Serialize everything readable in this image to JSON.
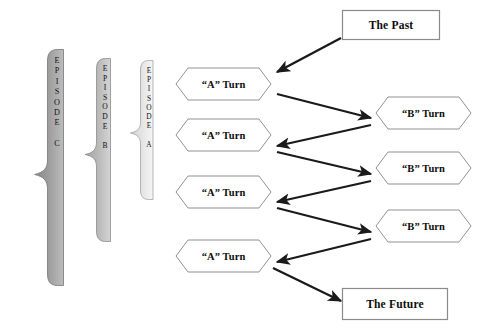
{
  "diagram": {
    "background_color": "#ffffff",
    "outline_color": "#808080",
    "arrow_color": "#1a1a1a",
    "text_color": "#0d0d0d"
  },
  "braces": [
    {
      "name": "episode-c",
      "label_letters": [
        "E",
        "P",
        "I",
        "S",
        "O",
        "D",
        "E",
        "",
        "C"
      ],
      "label_plain": "EPISODE C",
      "fill_dark": "#8d8d8d",
      "fill_light": "#b5b5b5",
      "stroke": "#7a7a7a"
    },
    {
      "name": "episode-b",
      "label_letters": [
        "E",
        "P",
        "I",
        "S",
        "O",
        "D",
        "E",
        "",
        "B"
      ],
      "label_plain": "EPISODE B",
      "fill_dark": "#a8a8a8",
      "fill_light": "#cecece",
      "stroke": "#8f8f8f"
    },
    {
      "name": "episode-a",
      "label_letters": [
        "E",
        "P",
        "I",
        "S",
        "O",
        "D",
        "E",
        "",
        "A"
      ],
      "label_plain": "EPISODE A",
      "fill_dark": "#d8d8d8",
      "fill_light": "#f2f2f2",
      "stroke": "#a6a6a6"
    }
  ],
  "a_turns": [
    {
      "name": "a-turn-1",
      "label": "“A” Turn"
    },
    {
      "name": "a-turn-2",
      "label": "“A” Turn"
    },
    {
      "name": "a-turn-3",
      "label": "“A” Turn"
    },
    {
      "name": "a-turn-4",
      "label": "“A” Turn"
    }
  ],
  "b_turns": [
    {
      "name": "b-turn-1",
      "label": "“B” Turn"
    },
    {
      "name": "b-turn-2",
      "label": "“B” Turn"
    },
    {
      "name": "b-turn-3",
      "label": "“B” Turn"
    }
  ],
  "boxes": {
    "past": {
      "name": "the-past-box",
      "label": "The Past"
    },
    "future": {
      "name": "the-future-box",
      "label": "The Future"
    }
  },
  "arrows": [
    {
      "name": "arrow-past-to-a1",
      "from": "The Past",
      "to": "“A” Turn 1",
      "direction": "down-left"
    },
    {
      "name": "arrow-a1-to-b1",
      "from": "“A” Turn 1",
      "to": "“B” Turn 1",
      "direction": "down-right"
    },
    {
      "name": "arrow-b1-to-a2",
      "from": "“B” Turn 1",
      "to": "“A” Turn 2",
      "direction": "down-left"
    },
    {
      "name": "arrow-a2-to-b2",
      "from": "“A” Turn 2",
      "to": "“B” Turn 2",
      "direction": "down-right"
    },
    {
      "name": "arrow-b2-to-a3",
      "from": "“B” Turn 2",
      "to": "“A” Turn 3",
      "direction": "down-left"
    },
    {
      "name": "arrow-a3-to-b3",
      "from": "“A” Turn 3",
      "to": "“B” Turn 3",
      "direction": "down-right"
    },
    {
      "name": "arrow-b3-to-a4",
      "from": "“B” Turn 3",
      "to": "“A” Turn 4",
      "direction": "down-left"
    },
    {
      "name": "arrow-a4-to-future",
      "from": "“A” Turn 4",
      "to": "The Future",
      "direction": "down-right"
    }
  ]
}
